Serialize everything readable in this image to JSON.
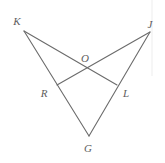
{
  "figure": {
    "width": 165,
    "height": 163,
    "background_color": "#ffffff",
    "stroke_color": "#6b6b6b",
    "label_color": "#5e5e5e",
    "stroke_width": 1.1
  },
  "points": [
    {
      "name": "K",
      "label": "K",
      "x": 24,
      "y": 31,
      "label_x": 17,
      "label_y": 21
    },
    {
      "name": "J",
      "label": "J",
      "x": 150,
      "y": 32,
      "label_x": 150,
      "label_y": 24
    },
    {
      "name": "O",
      "label": "O",
      "x": 87,
      "y": 69,
      "label_x": 85,
      "label_y": 58
    },
    {
      "name": "R",
      "label": "R",
      "x": 57,
      "y": 85,
      "label_x": 44,
      "label_y": 93
    },
    {
      "name": "L",
      "label": "L",
      "x": 117,
      "y": 85,
      "label_x": 126,
      "label_y": 93
    },
    {
      "name": "G",
      "label": "G",
      "x": 89,
      "y": 136,
      "label_x": 88,
      "label_y": 148
    }
  ],
  "segments": [
    {
      "name": "K-L",
      "from": "K",
      "to": "L",
      "x1": 24,
      "y1": 31,
      "x2": 117,
      "y2": 85
    },
    {
      "name": "K-G",
      "from": "K",
      "to": "G",
      "x1": 24,
      "y1": 31,
      "x2": 89,
      "y2": 136
    },
    {
      "name": "J-R",
      "from": "J",
      "to": "R",
      "x1": 150,
      "y1": 32,
      "x2": 57,
      "y2": 85
    },
    {
      "name": "J-G",
      "from": "J",
      "to": "G",
      "x1": 150,
      "y1": 32,
      "x2": 89,
      "y2": 136
    }
  ],
  "edge_artifact": {
    "name": "right-edge-line",
    "x": 152,
    "y1": 0,
    "y2": 76,
    "color": "#ededed"
  }
}
